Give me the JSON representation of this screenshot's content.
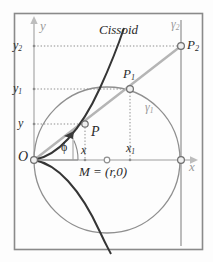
{
  "figure": {
    "curve_label": "Cissoid",
    "frame": {
      "x": 14,
      "y": 13,
      "width": 189,
      "height": 237,
      "color": "#8a8a8a"
    },
    "colors": {
      "curve": "#2d2d2d",
      "circle": "#8f8f8f",
      "axis": "#b4b4b4",
      "ray": "#b0b0b0",
      "dotted": "#8d8d8d",
      "label": "#2b2b2b",
      "label_gray": "#9a9a9a",
      "background": "#fdfdfd",
      "tangent_line": "#9a9a9a"
    },
    "axes": {
      "x_label": "x",
      "y_label": "y",
      "origin_label": "O",
      "origin": {
        "x": 34,
        "y": 160
      },
      "x_axis": {
        "x1": 34,
        "y1": 160,
        "x2": 196,
        "y2": 160
      },
      "y_axis": {
        "x1": 34,
        "y1": 160,
        "x2": 34,
        "y2": 18
      }
    },
    "circle": {
      "name": "gamma-1",
      "label": "γ",
      "label_sub": "1",
      "center_x": 107,
      "center_y": 160,
      "radius": 73,
      "center_label": "M = (r,0)",
      "center_point_label": "M",
      "radius_symbol": "r"
    },
    "vertical_line": {
      "name": "gamma-2",
      "label": "γ",
      "label_sub": "2",
      "x": 181,
      "y_top": 20,
      "y_bottom": 246
    },
    "points": [
      {
        "id": "P",
        "label": "P",
        "sub": "",
        "x": 85,
        "y": 124
      },
      {
        "id": "P1",
        "label": "P",
        "sub": "1",
        "x": 130,
        "y": 89
      },
      {
        "id": "P2",
        "label": "P",
        "sub": "2",
        "x": 181,
        "y": 46
      }
    ],
    "y_ticks": [
      {
        "label": "y",
        "sub": "2",
        "value_y": 46
      },
      {
        "label": "y",
        "sub": "1",
        "value_y": 89
      },
      {
        "label": "y",
        "sub": "",
        "value_y": 124
      }
    ],
    "x_ticks": [
      {
        "label": "x",
        "sub": "",
        "value_x": 85
      },
      {
        "label": "x",
        "sub": "1",
        "value_x": 130
      }
    ],
    "angle": {
      "label": "ϕ",
      "vertex_x": 34,
      "vertex_y": 160,
      "degrees": 25
    },
    "open_markers": [
      {
        "name": "origin-marker",
        "x": 34,
        "y": 160
      },
      {
        "name": "center-marker",
        "x": 107,
        "y": 160
      },
      {
        "name": "right-vertex-marker",
        "x": 181,
        "y": 160
      },
      {
        "name": "point-p-marker",
        "x": 85,
        "y": 124
      },
      {
        "name": "point-p1-marker",
        "x": 130,
        "y": 89
      },
      {
        "name": "point-p2-marker",
        "x": 181,
        "y": 46
      }
    ]
  }
}
